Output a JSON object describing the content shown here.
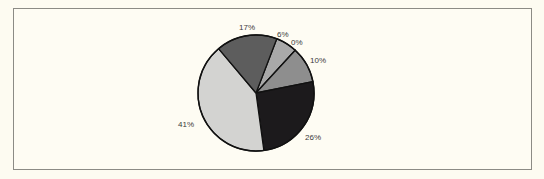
{
  "chart_data": {
    "type": "pie",
    "title": "",
    "slices": [
      {
        "label": "6%",
        "value": 6,
        "color": "#a9a9a9"
      },
      {
        "label": "0%",
        "value": 0,
        "color": "#b5b5b5"
      },
      {
        "label": "10%",
        "value": 10,
        "color": "#8e8e8e"
      },
      {
        "label": "26%",
        "value": 26,
        "color": "#1c1a1c"
      },
      {
        "label": "41%",
        "value": 41,
        "color": "#d3d3d1"
      },
      {
        "label": "17%",
        "value": 17,
        "color": "#5d5d5d"
      }
    ],
    "start_angle_deg": 21,
    "direction": "clockwise",
    "legend": "none"
  },
  "labels": {
    "l6": "6%",
    "l0": "0%",
    "l10": "10%",
    "l26": "26%",
    "l41": "41%",
    "l17": "17%"
  }
}
